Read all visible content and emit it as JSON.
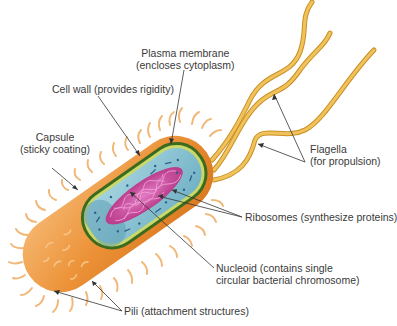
{
  "diagram": {
    "type": "labeled-illustration",
    "colors": {
      "capsule": "#e8892a",
      "capsule_light": "#f5b46a",
      "cell_wall": "#3d6b1e",
      "plasma_membrane": "#c9d86a",
      "cytoplasm": "#8fc6d6",
      "nucleoid": "#c2409a",
      "ribosomes": "#2b5f8a",
      "flagella": "#e9b84a",
      "pili": "#f0b97a",
      "leader_line": "#333333"
    },
    "labels": {
      "plasma_membrane": {
        "line1": "Plasma membrane",
        "line2": "(encloses cytoplasm)"
      },
      "cell_wall": {
        "line1": "Cell wall (provides rigidity)"
      },
      "capsule": {
        "line1": "Capsule",
        "line2": "(sticky coating)"
      },
      "flagella": {
        "line1": "Flagella",
        "line2": "(for propulsion)"
      },
      "ribosomes": {
        "line1": "Ribosomes (synthesize proteins)"
      },
      "nucleoid": {
        "line1": "Nucleoid (contains single",
        "line2": "circular bacterial chromosome)"
      },
      "pili": {
        "line1": "Pili (attachment structures)"
      }
    }
  }
}
